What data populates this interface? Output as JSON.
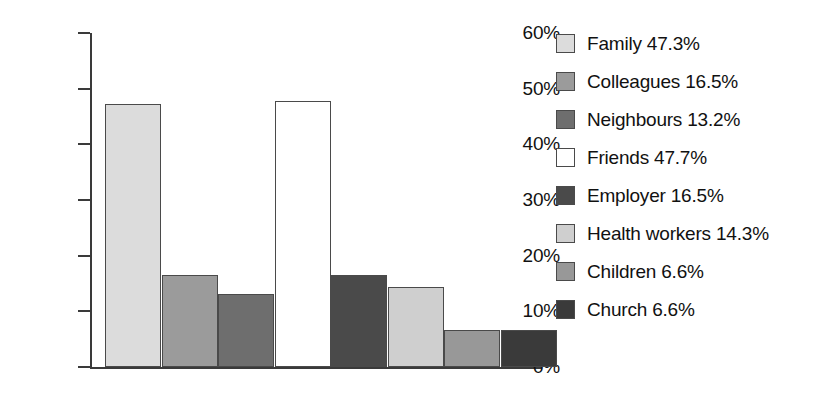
{
  "chart_data": {
    "type": "bar",
    "title": "",
    "subtitle": "",
    "xlabel": "",
    "ylabel": "",
    "ylim": [
      0,
      60
    ],
    "grid": false,
    "legend_position": "right",
    "ytick_labels": [
      "60%",
      "50%",
      "40%",
      "30%",
      "20%",
      "10%",
      "0%"
    ],
    "ytick_values": [
      60,
      50,
      40,
      30,
      20,
      10,
      0
    ],
    "categories": [
      "Family",
      "Colleagues",
      "Neighbours",
      "Friends",
      "Employer",
      "Health workers",
      "Children",
      "Church"
    ],
    "values": [
      47.3,
      16.5,
      13.2,
      47.7,
      16.5,
      14.3,
      6.6,
      6.6
    ],
    "value_labels": [
      "47.3%",
      "16.5%",
      "13.2%",
      "47.7%",
      "16.5%",
      "14.3%",
      "6.6%",
      "6.6%"
    ],
    "colors": [
      "#dcdcdc",
      "#9b9b9b",
      "#6e6e6e",
      "#ffffff",
      "#4a4a4a",
      "#cfcfcf",
      "#989898",
      "#3a3a3a"
    ],
    "series": [
      {
        "name": "Sources of support",
        "values": [
          47.3,
          16.5,
          13.2,
          47.7,
          16.5,
          14.3,
          6.6,
          6.6
        ]
      }
    ]
  },
  "legend": {
    "entries": [
      {
        "label": "Family 47.3%",
        "name": "Family",
        "value": "47.3%",
        "color": "#dcdcdc"
      },
      {
        "label": "Colleagues 16.5%",
        "name": "Colleagues",
        "value": "16.5%",
        "color": "#9b9b9b"
      },
      {
        "label": "Neighbours 13.2%",
        "name": "Neighbours",
        "value": "13.2%",
        "color": "#6e6e6e"
      },
      {
        "label": "Friends 47.7%",
        "name": "Friends",
        "value": "47.7%",
        "color": "#ffffff"
      },
      {
        "label": "Employer 16.5%",
        "name": "Employer",
        "value": "16.5%",
        "color": "#4a4a4a"
      },
      {
        "label": "Health workers 14.3%",
        "name": "Health workers",
        "value": "14.3%",
        "color": "#cfcfcf"
      },
      {
        "label": "Children 6.6%",
        "name": "Children",
        "value": "6.6%",
        "color": "#989898"
      },
      {
        "label": "Church 6.6%",
        "name": "Church",
        "value": "6.6%",
        "color": "#3a3a3a"
      }
    ]
  },
  "axis": {
    "y_ticks": [
      {
        "label": "60%"
      },
      {
        "label": "50%"
      },
      {
        "label": "40%"
      },
      {
        "label": "30%"
      },
      {
        "label": "20%"
      },
      {
        "label": "10%"
      },
      {
        "label": "0%"
      }
    ]
  }
}
